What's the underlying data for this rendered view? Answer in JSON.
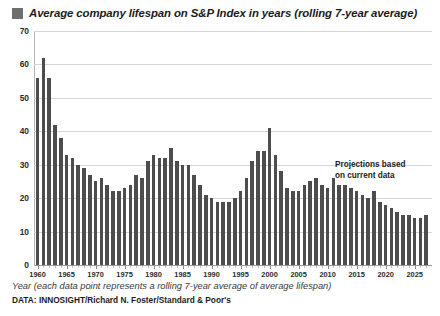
{
  "chart_data": {
    "type": "bar",
    "title": "Average company lifespan on S&P Index in years (rolling 7-year average)",
    "xlabel": "Year (each data point represents a rolling 7-year average of average lifespan)",
    "ylabel": "",
    "ylim": [
      0,
      70
    ],
    "yticks": [
      0,
      10,
      20,
      30,
      40,
      50,
      60,
      70
    ],
    "xticks": [
      1960,
      1965,
      1970,
      1975,
      1980,
      1985,
      1990,
      1995,
      2000,
      2005,
      2010,
      2015,
      2020,
      2025
    ],
    "grid": true,
    "legend_position": "top-left",
    "legend": [
      "Average company lifespan on S&P Index in years (rolling 7-year average)"
    ],
    "bar_color": "#4d4d4d",
    "legend_swatch_color": "#6e6e6e",
    "annotation": "Projections based on current data",
    "source": "DATA: INNOSIGHT/Richard N. Foster/Standard & Poor's",
    "categories": [
      1960,
      1961,
      1962,
      1963,
      1964,
      1965,
      1966,
      1967,
      1968,
      1969,
      1970,
      1971,
      1972,
      1973,
      1974,
      1975,
      1976,
      1977,
      1978,
      1979,
      1980,
      1981,
      1982,
      1983,
      1984,
      1985,
      1986,
      1987,
      1988,
      1989,
      1990,
      1991,
      1992,
      1993,
      1994,
      1995,
      1996,
      1997,
      1998,
      1999,
      2000,
      2001,
      2002,
      2003,
      2004,
      2005,
      2006,
      2007,
      2008,
      2009,
      2010,
      2011,
      2012,
      2013,
      2014,
      2015,
      2016,
      2017,
      2018,
      2019,
      2020,
      2021,
      2022,
      2023,
      2024,
      2025,
      2026,
      2027
    ],
    "values": [
      56,
      62,
      56,
      42,
      38,
      33,
      32,
      30,
      29,
      27,
      25,
      26,
      24,
      22,
      22,
      23,
      24,
      27,
      26,
      31,
      33,
      32,
      32,
      35,
      31,
      30,
      30,
      27,
      24,
      21,
      20,
      19,
      19,
      19,
      20,
      22,
      26,
      31,
      34,
      34,
      41,
      33,
      28,
      23,
      22,
      22,
      24,
      25,
      26,
      24,
      23,
      26,
      24,
      24,
      23,
      22,
      21,
      20,
      22,
      19,
      18,
      17,
      16,
      15,
      15,
      14,
      14,
      15
    ],
    "projection_start_index": 54,
    "series": [
      {
        "name": "Average company lifespan (rolling 7-year average)",
        "values": [
          56,
          62,
          56,
          42,
          38,
          33,
          32,
          30,
          29,
          27,
          25,
          26,
          24,
          22,
          22,
          23,
          24,
          27,
          26,
          31,
          33,
          32,
          32,
          35,
          31,
          30,
          30,
          27,
          24,
          21,
          20,
          19,
          19,
          19,
          20,
          22,
          26,
          31,
          34,
          34,
          41,
          33,
          28,
          23,
          22,
          22,
          24,
          25,
          26,
          24,
          23,
          26,
          24,
          24,
          23,
          22,
          21,
          20,
          22,
          19,
          18,
          17,
          16,
          15,
          15,
          14,
          14,
          15
        ]
      }
    ]
  },
  "footer": {
    "axis_caption": "Year (each data point represents a rolling 7-year average of average lifespan)",
    "source": "DATA: INNOSIGHT/Richard N. Foster/Standard & Poor's"
  },
  "annotation": {
    "line1": "Projections based",
    "line2": "on current data"
  }
}
